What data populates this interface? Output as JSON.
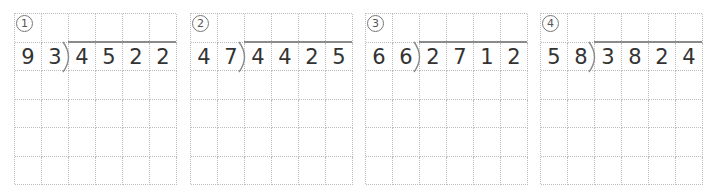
{
  "worksheet": {
    "problems": [
      {
        "label": "①",
        "divisor": [
          "9",
          "3"
        ],
        "dividend": [
          "4",
          "5",
          "2",
          "2"
        ]
      },
      {
        "label": "②",
        "divisor": [
          "4",
          "7"
        ],
        "dividend": [
          "4",
          "4",
          "2",
          "5"
        ]
      },
      {
        "label": "③",
        "divisor": [
          "6",
          "6"
        ],
        "dividend": [
          "2",
          "7",
          "1",
          "2"
        ]
      },
      {
        "label": "④",
        "divisor": [
          "5",
          "8"
        ],
        "dividend": [
          "3",
          "8",
          "2",
          "4"
        ]
      }
    ],
    "grid": {
      "columns": 6,
      "rows": 6
    },
    "colors": {
      "grid_line": "#bdbdbd",
      "digit": "#333333",
      "division_bar": "#8a8a8a"
    }
  }
}
